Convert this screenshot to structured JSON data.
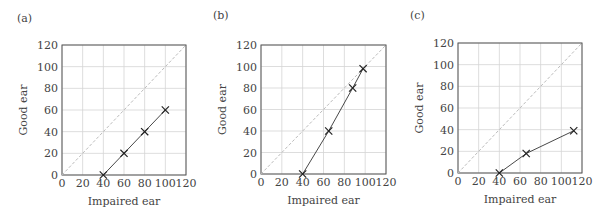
{
  "chart_data": [
    {
      "type": "line",
      "panel_label": "(a)",
      "xlabel": "Impaired ear",
      "ylabel": "Good ear",
      "xlim": [
        0,
        120
      ],
      "ylim": [
        0,
        120
      ],
      "xticks": [
        0,
        20,
        40,
        60,
        80,
        100,
        120
      ],
      "yticks": [
        0,
        20,
        40,
        60,
        80,
        100,
        120
      ],
      "grid": true,
      "reference_line": {
        "style": "dashed",
        "from": [
          0,
          0
        ],
        "to": [
          120,
          120
        ]
      },
      "series": [
        {
          "name": "data",
          "marker": "x",
          "x": [
            40,
            60,
            80,
            100
          ],
          "y": [
            0,
            20,
            40,
            60
          ]
        }
      ]
    },
    {
      "type": "line",
      "panel_label": "(b)",
      "xlabel": "Impaired ear",
      "ylabel": "Good ear",
      "xlim": [
        0,
        120
      ],
      "ylim": [
        0,
        120
      ],
      "xticks": [
        0,
        20,
        40,
        60,
        80,
        100,
        120
      ],
      "yticks": [
        0,
        20,
        40,
        60,
        80,
        100,
        120
      ],
      "grid": true,
      "reference_line": {
        "style": "dashed",
        "from": [
          0,
          0
        ],
        "to": [
          120,
          120
        ]
      },
      "series": [
        {
          "name": "data",
          "marker": "x",
          "x": [
            40,
            65,
            88,
            98
          ],
          "y": [
            0,
            40,
            80,
            98
          ]
        }
      ]
    },
    {
      "type": "line",
      "panel_label": "(c)",
      "xlabel": "Impaired ear",
      "ylabel": "Good ear",
      "xlim": [
        0,
        120
      ],
      "ylim": [
        0,
        120
      ],
      "xticks": [
        0,
        20,
        40,
        60,
        80,
        100,
        120
      ],
      "yticks": [
        0,
        20,
        40,
        60,
        80,
        100,
        120
      ],
      "grid": true,
      "reference_line": {
        "style": "dashed",
        "from": [
          0,
          0
        ],
        "to": [
          120,
          120
        ]
      },
      "series": [
        {
          "name": "data",
          "marker": "x",
          "x": [
            40,
            66,
            112
          ],
          "y": [
            0,
            18,
            39
          ]
        }
      ]
    }
  ],
  "layout": {
    "panels": [
      {
        "left": 0,
        "plot_x": 62,
        "plot_y": 45,
        "plot_w": 124,
        "plot_h": 130,
        "label_x": 17,
        "label_y": 22
      },
      {
        "left": 199,
        "plot_x": 62,
        "plot_y": 45,
        "plot_w": 125,
        "plot_h": 129,
        "label_x": 14,
        "label_y": 19
      },
      {
        "left": 396,
        "plot_x": 62,
        "plot_y": 43,
        "plot_w": 124,
        "plot_h": 130,
        "label_x": 14,
        "label_y": 19
      }
    ]
  }
}
